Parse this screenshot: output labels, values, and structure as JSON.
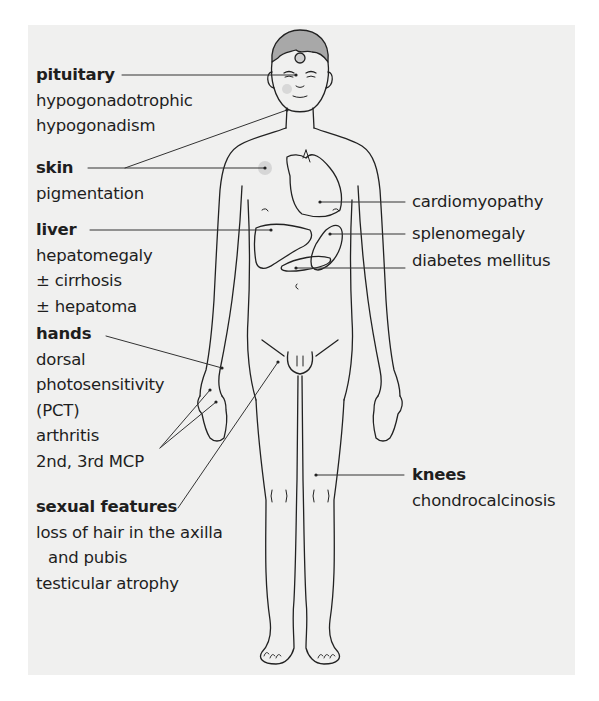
{
  "figure": {
    "panel_color": "#f0f0ef",
    "line_color": "#222222",
    "hair_color": "#a8a8a8"
  },
  "labels": {
    "pituitary": {
      "title": "pituitary",
      "lines": [
        "hypogonadotrophic",
        "hypogonadism"
      ]
    },
    "skin": {
      "title": "skin",
      "lines": [
        "pigmentation"
      ]
    },
    "liver": {
      "title": "liver",
      "lines": [
        "hepatomegaly",
        "± cirrhosis",
        "± hepatoma"
      ]
    },
    "hands": {
      "title": "hands",
      "lines": [
        "dorsal",
        "photosensitivity",
        "(PCT)",
        "arthritis",
        "2nd, 3rd MCP"
      ]
    },
    "sexual": {
      "title": "sexual features",
      "lines": [
        "loss of hair in the axilla",
        "and pubis",
        "testicular atrophy"
      ]
    },
    "knees": {
      "title": "knees",
      "lines": [
        "chondrocalcinosis"
      ]
    },
    "heart": {
      "text": "cardiomyopathy"
    },
    "spleen": {
      "text": "splenomegaly"
    },
    "pancreas": {
      "text": "diabetes mellitus"
    }
  }
}
